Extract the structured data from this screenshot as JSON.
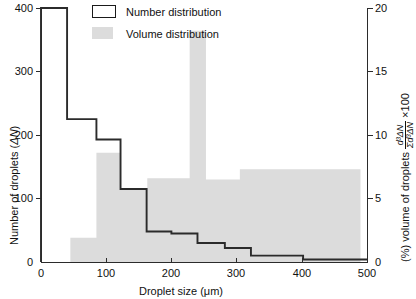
{
  "chart_data": {
    "type": "bar",
    "title": "",
    "xlabel": "Droplet size (µm)",
    "ylabel_left": "Number of droplets (ΔN)",
    "ylabel_right": "(%) volume of droplets  d³ΔN / Σd³ΔN ×100",
    "xlim": [
      0,
      500
    ],
    "ylim_left": [
      0,
      400
    ],
    "ylim_right": [
      0,
      20
    ],
    "xticks": [
      0,
      100,
      200,
      300,
      400,
      500
    ],
    "yticks_left": [
      0,
      100,
      200,
      300,
      400
    ],
    "yticks_right": [
      0,
      5,
      10,
      15,
      20
    ],
    "grid": false,
    "legend_position": "top-center",
    "series": [
      {
        "name": "Number distribution",
        "style": "step-line",
        "color": "#2b2b2b",
        "axis": "left",
        "units": "ΔN",
        "bins": [
          {
            "x0": 0,
            "x1": 40,
            "value": 400
          },
          {
            "x0": 40,
            "x1": 85,
            "value": 225
          },
          {
            "x0": 85,
            "x1": 122,
            "value": 193
          },
          {
            "x0": 122,
            "x1": 162,
            "value": 115
          },
          {
            "x0": 162,
            "x1": 200,
            "value": 48
          },
          {
            "x0": 200,
            "x1": 240,
            "value": 45
          },
          {
            "x0": 240,
            "x1": 282,
            "value": 30
          },
          {
            "x0": 282,
            "x1": 322,
            "value": 22
          },
          {
            "x0": 322,
            "x1": 402,
            "value": 10
          },
          {
            "x0": 402,
            "x1": 500,
            "value": 4
          }
        ]
      },
      {
        "name": "Volume distribution",
        "style": "filled-histogram",
        "color": "#dcdcdc",
        "axis": "right",
        "units": "%",
        "bins": [
          {
            "x0": 45,
            "x1": 85,
            "value": 1.9
          },
          {
            "x0": 85,
            "x1": 122,
            "value": 8.6
          },
          {
            "x0": 122,
            "x1": 163,
            "value": 5.8
          },
          {
            "x0": 163,
            "x1": 228,
            "value": 6.6
          },
          {
            "x0": 228,
            "x1": 253,
            "value": 18.2
          },
          {
            "x0": 253,
            "x1": 305,
            "value": 6.5
          },
          {
            "x0": 305,
            "x1": 490,
            "value": 7.3
          }
        ]
      }
    ]
  },
  "legend": {
    "entries": [
      {
        "label": "Number distribution",
        "swatch": "outline-box"
      },
      {
        "label": "Volume distribution",
        "swatch": "gray-box"
      }
    ]
  },
  "axes": {
    "x_title": "Droplet size (μm)",
    "x_tick_labels": [
      "0",
      "100",
      "200",
      "300",
      "400",
      "500"
    ],
    "y_left_title_a": "Number of droplets (",
    "y_left_title_b": "ΔN",
    "y_left_title_c": ")",
    "y_left_tick_labels": [
      "400",
      "300",
      "200",
      "100",
      "0"
    ],
    "y_right_tick_labels": [
      "20",
      "15",
      "10",
      "5",
      "0"
    ],
    "y_right_title_a": "(%) volume of droplets",
    "y_right_frac_num": "d³ΔN",
    "y_right_frac_den": "Σd³ΔN",
    "y_right_title_b": "×100"
  },
  "colors": {
    "line": "#2b2b2b",
    "fill": "#dcdcdc",
    "axis": "#2b2b2b",
    "background": "#ffffff"
  }
}
